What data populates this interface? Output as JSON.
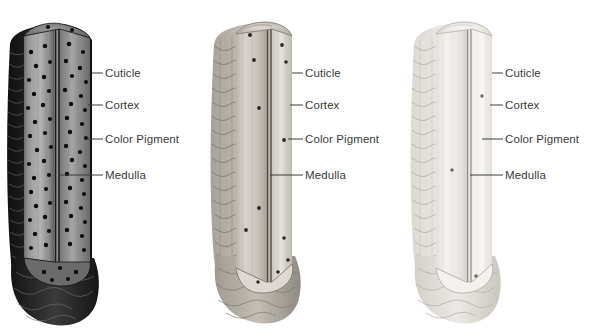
{
  "figure": {
    "background_color": "#ffffff",
    "label_color": "#3b3b3b",
    "panel_count": 3
  },
  "labels": {
    "cuticle": "Cuticle",
    "cortex": "Cortex",
    "color_pigment": "Color Pigment",
    "medulla": "Medulla"
  },
  "panels": [
    {
      "id": "dark",
      "name": "dark-hair-shaft",
      "pigment_density": "high",
      "shaft_tone": "#8d8d8d",
      "cuticle_tone": "#2a2a2a",
      "labels": {
        "cuticle": "Cuticle",
        "cortex": "Cortex",
        "color_pigment": "Color Pigment",
        "medulla": "Medulla"
      }
    },
    {
      "id": "medium",
      "name": "medium-hair-shaft",
      "pigment_density": "medium",
      "shaft_tone": "#cfcbc4",
      "cuticle_tone": "#9a968e",
      "labels": {
        "cuticle": "Cuticle",
        "cortex": "Cortex",
        "color_pigment": "Color Pigment",
        "medulla": "Medulla"
      }
    },
    {
      "id": "light",
      "name": "light-hair-shaft",
      "pigment_density": "low",
      "shaft_tone": "#f0eeea",
      "cuticle_tone": "#ddd9d3",
      "labels": {
        "cuticle": "Cuticle",
        "cortex": "Cortex",
        "color_pigment": "Color Pigment",
        "medulla": "Medulla"
      }
    }
  ]
}
